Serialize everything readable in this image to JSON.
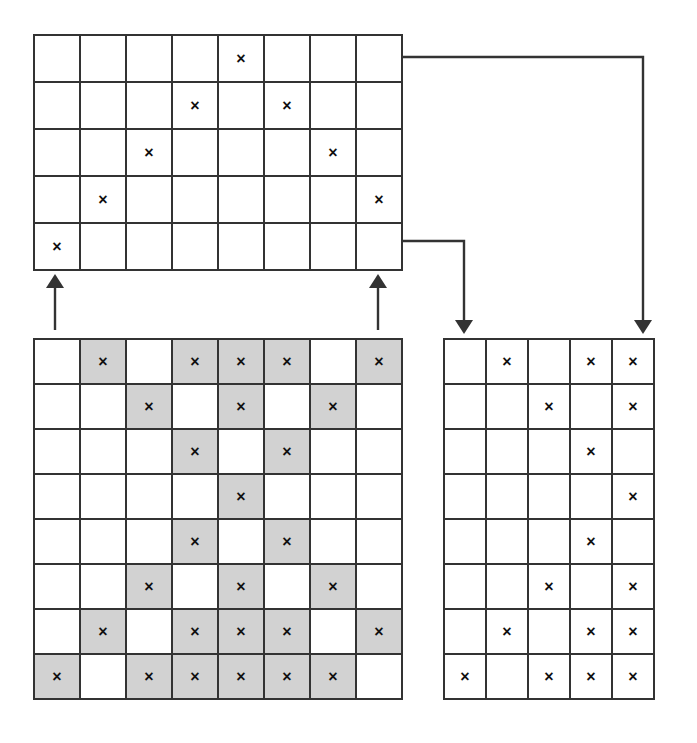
{
  "figure": {
    "type": "grid-dataflow-diagram",
    "background_color": "#ffffff",
    "line_color": "#333333",
    "mark_glyph": "×",
    "shade_color": "#d2d2d2"
  },
  "grids": {
    "top": {
      "name": "top-grid",
      "columns": 8,
      "rows": 5,
      "cell_width": 46,
      "cell_height": 47,
      "x": 33,
      "y": 34,
      "shading_enabled": false,
      "marked_cells": [
        [
          0,
          0,
          0,
          0,
          1,
          0,
          0,
          0
        ],
        [
          0,
          0,
          0,
          1,
          0,
          1,
          0,
          0
        ],
        [
          0,
          0,
          1,
          0,
          0,
          0,
          1,
          0
        ],
        [
          0,
          1,
          0,
          0,
          0,
          0,
          0,
          1
        ],
        [
          1,
          0,
          0,
          0,
          0,
          0,
          0,
          0
        ]
      ],
      "shaded_cells": [
        [
          0,
          0,
          0,
          0,
          0,
          0,
          0,
          0
        ],
        [
          0,
          0,
          0,
          0,
          0,
          0,
          0,
          0
        ],
        [
          0,
          0,
          0,
          0,
          0,
          0,
          0,
          0
        ],
        [
          0,
          0,
          0,
          0,
          0,
          0,
          0,
          0
        ],
        [
          0,
          0,
          0,
          0,
          0,
          0,
          0,
          0
        ]
      ]
    },
    "bottom_left": {
      "name": "bottom-left-grid",
      "columns": 8,
      "rows": 8,
      "cell_width": 46,
      "cell_height": 45,
      "x": 33,
      "y": 338,
      "shading_enabled": true,
      "marked_cells": [
        [
          0,
          1,
          0,
          1,
          1,
          1,
          0,
          1
        ],
        [
          0,
          0,
          1,
          0,
          1,
          0,
          1,
          0
        ],
        [
          0,
          0,
          0,
          1,
          0,
          1,
          0,
          0
        ],
        [
          0,
          0,
          0,
          0,
          1,
          0,
          0,
          0
        ],
        [
          0,
          0,
          0,
          1,
          0,
          1,
          0,
          0
        ],
        [
          0,
          0,
          1,
          0,
          1,
          0,
          1,
          0
        ],
        [
          0,
          1,
          0,
          1,
          1,
          1,
          0,
          1
        ],
        [
          1,
          0,
          1,
          1,
          1,
          1,
          1,
          0
        ]
      ],
      "shaded_cells": [
        [
          0,
          1,
          0,
          1,
          1,
          1,
          0,
          1
        ],
        [
          0,
          0,
          1,
          0,
          1,
          0,
          1,
          0
        ],
        [
          0,
          0,
          0,
          1,
          0,
          1,
          0,
          0
        ],
        [
          0,
          0,
          0,
          0,
          1,
          0,
          0,
          0
        ],
        [
          0,
          0,
          0,
          1,
          0,
          1,
          0,
          0
        ],
        [
          0,
          0,
          1,
          0,
          1,
          0,
          1,
          0
        ],
        [
          0,
          1,
          0,
          1,
          1,
          1,
          0,
          1
        ],
        [
          1,
          0,
          1,
          1,
          1,
          1,
          1,
          0
        ]
      ]
    },
    "bottom_right": {
      "name": "bottom-right-grid",
      "columns": 5,
      "rows": 8,
      "cell_width": 42,
      "cell_height": 45,
      "x": 443,
      "y": 338,
      "shading_enabled": false,
      "marked_cells": [
        [
          0,
          1,
          0,
          1,
          1
        ],
        [
          0,
          0,
          1,
          0,
          1
        ],
        [
          0,
          0,
          0,
          1,
          0
        ],
        [
          0,
          0,
          0,
          0,
          1
        ],
        [
          0,
          0,
          0,
          1,
          0
        ],
        [
          0,
          0,
          1,
          0,
          1
        ],
        [
          0,
          1,
          0,
          1,
          1
        ],
        [
          1,
          0,
          1,
          1,
          1
        ]
      ],
      "shaded_cells": [
        [
          0,
          0,
          0,
          0,
          0
        ],
        [
          0,
          0,
          0,
          0,
          0
        ],
        [
          0,
          0,
          0,
          0,
          0
        ],
        [
          0,
          0,
          0,
          0,
          0
        ],
        [
          0,
          0,
          0,
          0,
          0
        ],
        [
          0,
          0,
          0,
          0,
          0
        ],
        [
          0,
          0,
          0,
          0,
          0
        ],
        [
          0,
          0,
          0,
          0,
          0
        ]
      ]
    }
  },
  "connectors": [
    {
      "name": "arrow-bottom-left-to-top-left",
      "direction": "up",
      "points": "55,330 55,282",
      "head": "up",
      "head_x": 55,
      "head_y": 274
    },
    {
      "name": "arrow-bottom-left-to-top-right",
      "direction": "up",
      "points": "378,330 378,282",
      "head": "up",
      "head_x": 378,
      "head_y": 274
    },
    {
      "name": "arrow-top-right-upper-to-bottom-right",
      "direction": "down",
      "points": "403,57 643,57 643,322",
      "head": "down",
      "head_x": 643,
      "head_y": 334
    },
    {
      "name": "arrow-top-right-lower-to-bottom-right",
      "direction": "down",
      "points": "403,241 464,241 464,322",
      "head": "down",
      "head_x": 464,
      "head_y": 334
    }
  ]
}
